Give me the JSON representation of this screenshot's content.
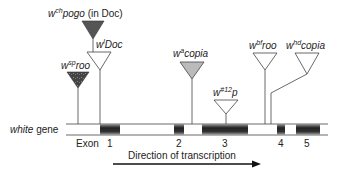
{
  "diagram": {
    "gene_label_italic": "white",
    "gene_label_rest": " gene",
    "exon_label": "Exon",
    "exons": [
      {
        "number": "1",
        "x": 100,
        "w": 20
      },
      {
        "number": "2",
        "x": 174,
        "w": 10
      },
      {
        "number": "3",
        "x": 202,
        "w": 46
      },
      {
        "number": "4",
        "x": 277,
        "w": 8
      },
      {
        "number": "5",
        "x": 296,
        "w": 24
      }
    ],
    "direction_label": "Direction of transcription",
    "insertions": [
      {
        "id": "ch-pogo",
        "prefix": "w",
        "sup": "ch",
        "name": "pogo",
        "suffix": " (in Doc)",
        "fill": "#555555"
      },
      {
        "id": "l-doc",
        "prefix": "w",
        "sup": "l",
        "name": "Doc",
        "suffix": "",
        "fill": "#ffffff"
      },
      {
        "id": "sp-roo",
        "prefix": "w",
        "sup": "sp",
        "name": "roo",
        "suffix": "",
        "fill": "#444444"
      },
      {
        "id": "a-copia",
        "prefix": "w",
        "sup": "a",
        "name": "copia",
        "suffix": "",
        "fill": "#bbbbbb"
      },
      {
        "id": "12-p",
        "prefix": "w",
        "sup": "#12",
        "name": "p",
        "suffix": "",
        "fill": "#ffffff"
      },
      {
        "id": "bf-roo",
        "prefix": "w",
        "sup": "bf",
        "name": "roo",
        "suffix": "",
        "fill": "#ffffff"
      },
      {
        "id": "hd-copia",
        "prefix": "w",
        "sup": "hd",
        "name": "copia",
        "suffix": "",
        "fill": "#ffffff"
      }
    ]
  }
}
